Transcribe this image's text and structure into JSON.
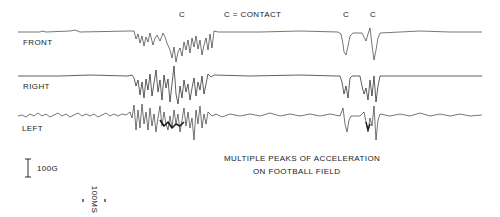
{
  "figure": {
    "contact_markers": [
      {
        "label": "C",
        "x": 182
      },
      {
        "label": "C",
        "x": 346
      },
      {
        "label": "C",
        "x": 373
      }
    ],
    "legend_contact": "C = CONTACT",
    "channels": [
      {
        "label": "FRONT",
        "baseline_y": 32
      },
      {
        "label": "RIGHT",
        "baseline_y": 76
      },
      {
        "label": "LEFT",
        "baseline_y": 116
      }
    ],
    "scale_acceleration": "100G",
    "scale_time": "100MS",
    "caption_line1": "MULTIPLE PEAKS OF ACCELERATION",
    "caption_line2": "ON FOOTBALL FIELD",
    "trace_color": "#1a1a1a"
  }
}
